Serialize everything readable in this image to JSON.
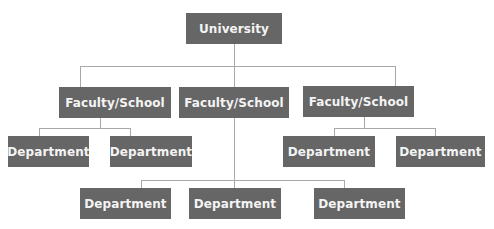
{
  "diagram": {
    "type": "org-chart",
    "colors": {
      "node_fill": "#666666",
      "node_text": "#f4f4f4",
      "connector": "#a8a8a8",
      "background": "#ffffff"
    },
    "root": {
      "label": "University"
    },
    "faculties": [
      {
        "label": "Faculty/School",
        "departments": [
          {
            "label": "Department"
          },
          {
            "label": "Department"
          }
        ]
      },
      {
        "label": "Faculty/School",
        "departments": [
          {
            "label": "Department"
          },
          {
            "label": "Department"
          },
          {
            "label": "Department"
          }
        ]
      },
      {
        "label": "Faculty/School",
        "departments": [
          {
            "label": "Department"
          },
          {
            "label": "Department"
          }
        ]
      }
    ]
  }
}
